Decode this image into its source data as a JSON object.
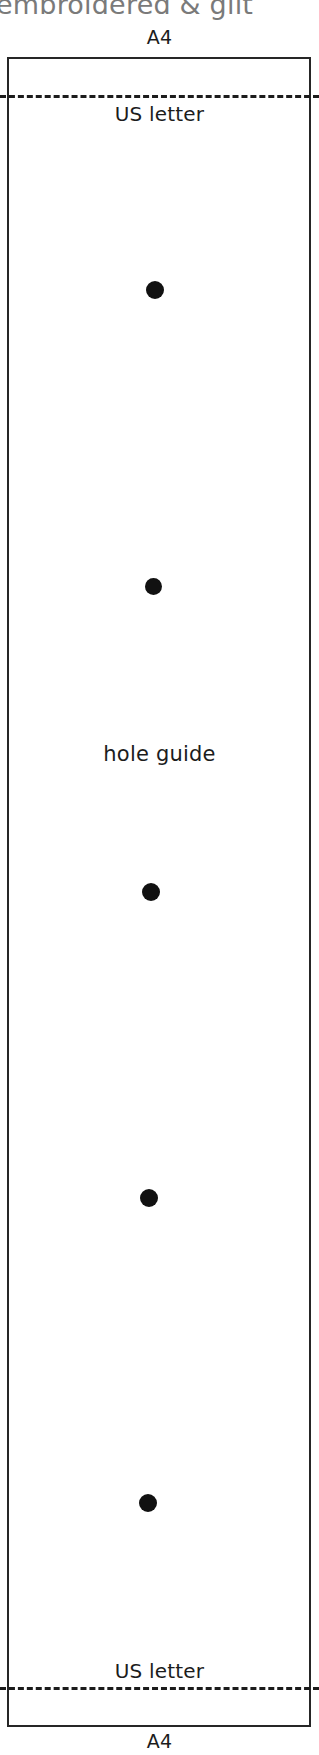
{
  "document": {
    "clipped_heading": "embroidered & gilt",
    "sheet_label_top": "A4",
    "sheet_label_bottom": "A4",
    "trim_label_top": "US letter",
    "trim_label_bottom": "US letter",
    "annotation": "hole guide"
  },
  "colors": {
    "sheet_border": "#262626",
    "trim_line": "#1c1c1c",
    "hole_fill": "#111111",
    "heading_text": "#7a7a7a",
    "body_text": "#1c1c1c",
    "page_background": "#ffffff"
  },
  "sheet": {
    "left": 7,
    "top": 57,
    "width": 304,
    "height": 1670
  },
  "trim_lines": [
    {
      "name": "top",
      "y": 95,
      "style": "dashed"
    },
    {
      "name": "bottom",
      "y": 1687,
      "style": "dashed"
    }
  ],
  "holes": [
    {
      "index": 1,
      "cx": 155,
      "cy": 290,
      "d": 18
    },
    {
      "index": 2,
      "cx": 153,
      "cy": 586,
      "d": 17
    },
    {
      "index": 3,
      "cx": 151,
      "cy": 892,
      "d": 18
    },
    {
      "index": 4,
      "cx": 149,
      "cy": 1198,
      "d": 18
    },
    {
      "index": 5,
      "cx": 148,
      "cy": 1503,
      "d": 18
    }
  ],
  "annotation_position": {
    "cy": 755
  }
}
